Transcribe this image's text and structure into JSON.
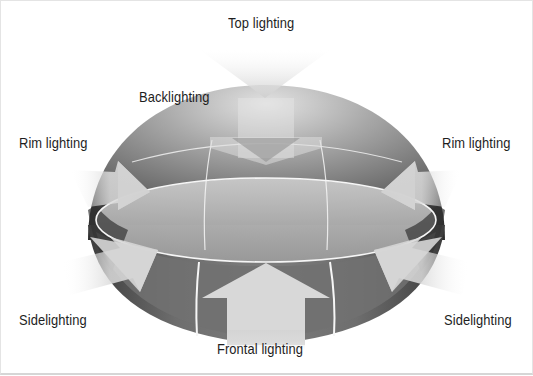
{
  "diagram": {
    "type": "lighting-directions-dome",
    "labels": {
      "top": "Top lighting",
      "back": "Backlighting",
      "rim_left": "Rim lighting",
      "rim_right": "Rim lighting",
      "side_left": "Sidelighting",
      "side_right": "Sidelighting",
      "front": "Frontal lighting"
    },
    "colors": {
      "dome_dark": "#3a3a3a",
      "dome_mid": "#7a7a7a",
      "dome_light": "#bdbdbd",
      "arrow": "#d4d4d4",
      "grid_line": "#f4f4f4",
      "text": "#1e1e1e"
    }
  }
}
